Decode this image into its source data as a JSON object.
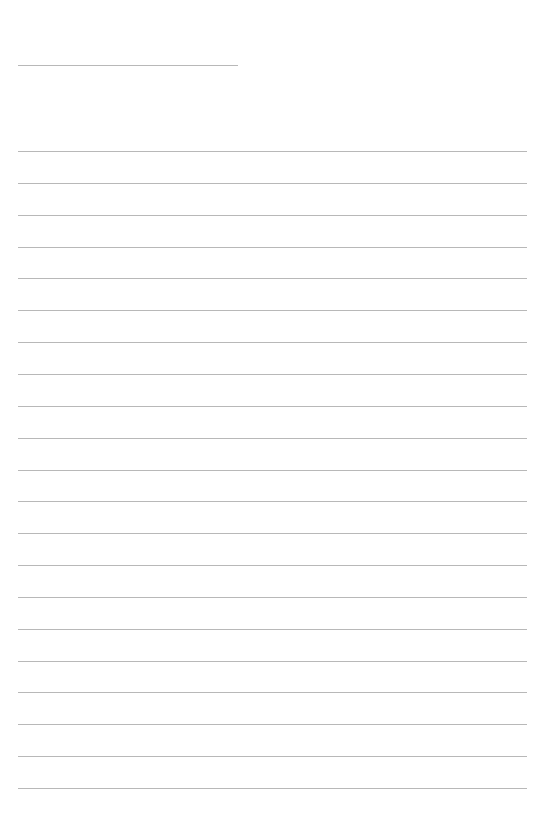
{
  "page": {
    "type": "lined-paper",
    "background_color": "#ffffff",
    "line_color": "#b8b8b8",
    "header_line": {
      "x": 18,
      "y": 65,
      "width": 220
    },
    "ruled_lines": {
      "count": 21,
      "start_y": 151,
      "spacing": 31.85,
      "x": 18,
      "width": 509
    }
  }
}
